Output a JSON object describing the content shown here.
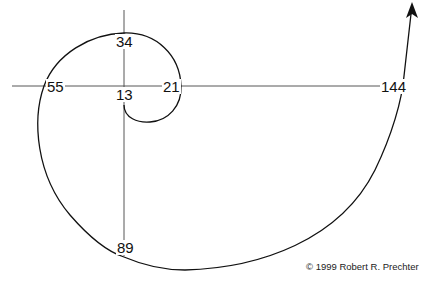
{
  "diagram": {
    "type": "fibonacci-spiral",
    "labels": {
      "l13": "13",
      "l21": "21",
      "l34": "34",
      "l55": "55",
      "l89": "89",
      "l144": "144"
    },
    "copyright": "© 1999 Robert R. Prechter",
    "colors": {
      "line": "#111111",
      "axis": "#333333",
      "background": "#ffffff"
    }
  }
}
